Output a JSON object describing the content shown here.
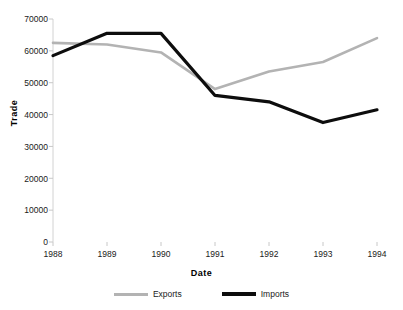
{
  "chart_data": {
    "type": "line",
    "title": "",
    "xlabel": "Date",
    "ylabel": "Trade",
    "categories": [
      "1988",
      "1989",
      "1990",
      "1991",
      "1992",
      "1993",
      "1994"
    ],
    "x": [
      1988,
      1989,
      1990,
      1991,
      1992,
      1993,
      1994
    ],
    "series": [
      {
        "name": "Exports",
        "color": "#b3b3b3",
        "values": [
          62500,
          62000,
          59500,
          48000,
          53500,
          56500,
          64000
        ]
      },
      {
        "name": "Imports",
        "color": "#0d0d0d",
        "values": [
          58500,
          65500,
          65500,
          46000,
          44000,
          37500,
          41500
        ]
      }
    ],
    "ylim": [
      0,
      70000
    ],
    "ytick_labels": [
      "70000",
      "60000",
      "50000",
      "40000",
      "30000",
      "20000",
      "10000",
      "0"
    ],
    "ytick_values": [
      70000,
      60000,
      50000,
      40000,
      30000,
      20000,
      10000,
      0
    ],
    "grid": false,
    "legend_position": "bottom"
  },
  "legend": {
    "items": [
      {
        "label": "Exports",
        "color": "#b3b3b3"
      },
      {
        "label": "Imports",
        "color": "#0d0d0d"
      }
    ]
  },
  "axes": {
    "y_axis_title": "Trade",
    "x_axis_title": "Date"
  }
}
